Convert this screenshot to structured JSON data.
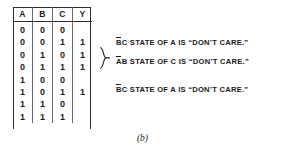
{
  "figure": {
    "caption": "(b)"
  },
  "table": {
    "columns": [
      "A",
      "B",
      "C",
      "Y"
    ],
    "rows": [
      {
        "A": "0",
        "B": "0",
        "C": "0",
        "Y": ""
      },
      {
        "A": "0",
        "B": "0",
        "C": "1",
        "Y": "1"
      },
      {
        "A": "0",
        "B": "1",
        "C": "0",
        "Y": "1"
      },
      {
        "A": "0",
        "B": "1",
        "C": "1",
        "Y": "1"
      },
      {
        "A": "1",
        "B": "0",
        "C": "0",
        "Y": ""
      },
      {
        "A": "1",
        "B": "0",
        "C": "1",
        "Y": "1"
      },
      {
        "A": "1",
        "B": "1",
        "C": "0",
        "Y": ""
      },
      {
        "A": "1",
        "B": "1",
        "C": "1",
        "Y": ""
      }
    ]
  },
  "annotations": [
    {
      "overlined": "B",
      "rest": "C STATE OF A IS “DON’T CARE.”",
      "full_text": "B̄C STATE OF A IS “DON’T CARE.”"
    },
    {
      "overlined": "A",
      "rest": "B STATE OF C IS “DON’T CARE.”",
      "full_text": "ĀB STATE OF C IS “DON’T CARE.”"
    },
    {
      "overlined": "B",
      "rest": "C STATE OF A IS “DON’T CARE.”",
      "full_text": "B̄C STATE OF A IS “DON’T CARE.”"
    }
  ],
  "brace": {
    "icon": "right-curly-brace-icon"
  }
}
